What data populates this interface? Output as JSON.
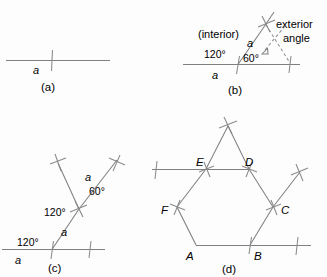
{
  "figure": {
    "background_color": "#fdfdfd",
    "line_color": "#808080",
    "text_color": "#6e6e6e",
    "panels": [
      {
        "id": "a",
        "caption": "(a)",
        "segment_label": "a",
        "description": "A straight line with a tick mark defining segment of length a"
      },
      {
        "id": "b",
        "caption": "(b)",
        "labels": {
          "interior": "(interior)",
          "interior_angle": "120°",
          "exterior_angle_value": "60°",
          "exterior_note": "exterior\nangle",
          "exterior_note_line1": "exterior",
          "exterior_note_line2": "angle",
          "side_a_base": "a",
          "side_a_slant": "a"
        }
      },
      {
        "id": "c",
        "caption": "(c)",
        "labels": {
          "angle_top": "60°",
          "angle_mid": "120°",
          "angle_bottom": "120°",
          "side_upper": "a",
          "side_lower": "a",
          "side_base": "a"
        }
      },
      {
        "id": "d",
        "caption": "(d)",
        "vertices": [
          "A",
          "B",
          "C",
          "D",
          "E",
          "F"
        ]
      }
    ]
  }
}
